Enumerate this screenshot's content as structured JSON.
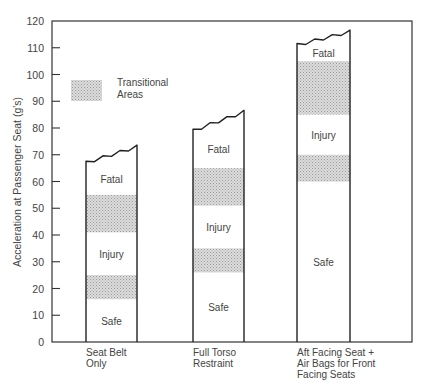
{
  "chart_data": {
    "type": "bar",
    "title": "",
    "xlabel": "",
    "ylabel": "Acceleration at Passenger Seat (g's)",
    "ylim": [
      0,
      120
    ],
    "yticks": [
      0,
      10,
      20,
      30,
      40,
      50,
      60,
      70,
      80,
      90,
      100,
      110,
      120
    ],
    "grid": false,
    "legend": {
      "position": "upper-left",
      "entries": [
        {
          "label": "Transitional Areas",
          "style": "stippled-gray"
        }
      ]
    },
    "categories": [
      "Seat Belt Only",
      "Full Torso Restraint",
      "Aft Facing Seat + Air Bags for Front Facing Seats"
    ],
    "category_lines": [
      [
        "Seat Belt",
        "Only"
      ],
      [
        "Full Torso",
        "Restraint"
      ],
      [
        "Aft Facing Seat +",
        "Air Bags for Front",
        "Facing Seats"
      ]
    ],
    "bars": [
      {
        "category": "Seat Belt Only",
        "top_range": [
          67,
          73
        ],
        "zones": [
          {
            "label": "Safe",
            "from": 0,
            "to": 16
          },
          {
            "label": "Transitional",
            "from": 16,
            "to": 25
          },
          {
            "label": "Injury",
            "from": 25,
            "to": 41
          },
          {
            "label": "Transitional",
            "from": 41,
            "to": 55
          },
          {
            "label": "Fatal",
            "from": 55,
            "to": 73
          }
        ]
      },
      {
        "category": "Full Torso Restraint",
        "top_range": [
          79,
          86
        ],
        "zones": [
          {
            "label": "Safe",
            "from": 0,
            "to": 26
          },
          {
            "label": "Transitional",
            "from": 26,
            "to": 35
          },
          {
            "label": "Injury",
            "from": 35,
            "to": 51
          },
          {
            "label": "Transitional",
            "from": 51,
            "to": 65
          },
          {
            "label": "Fatal",
            "from": 65,
            "to": 86
          }
        ]
      },
      {
        "category": "Aft Facing Seat + Air Bags for Front Facing Seats",
        "top_range": [
          111,
          116
        ],
        "zones": [
          {
            "label": "Safe",
            "from": 0,
            "to": 60
          },
          {
            "label": "Transitional",
            "from": 60,
            "to": 70
          },
          {
            "label": "Injury",
            "from": 70,
            "to": 85
          },
          {
            "label": "Transitional",
            "from": 85,
            "to": 105
          },
          {
            "label": "Fatal",
            "from": 105,
            "to": 116
          }
        ]
      }
    ]
  },
  "legend": {
    "line1": "Transitional",
    "line2": "Areas"
  },
  "axis": {
    "ylabel": "Acceleration at Passenger Seat (g's)"
  },
  "zone_labels": {
    "safe": "Safe",
    "injury": "Injury",
    "fatal": "Fatal"
  },
  "colors": {
    "frame": "#333333",
    "transitional": "#c8c8c8",
    "background": "#ffffff"
  }
}
